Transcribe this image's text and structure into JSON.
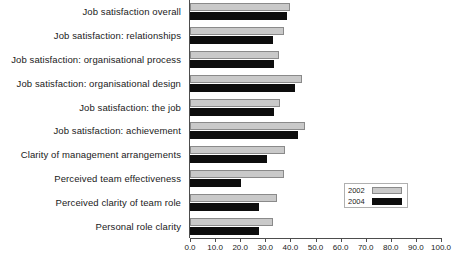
{
  "chart_data": {
    "type": "bar",
    "orientation": "horizontal",
    "title": "",
    "xlabel": "",
    "ylabel": "",
    "xlim": [
      0,
      100
    ],
    "grid": false,
    "legend_position": "lower-right",
    "categories": [
      "Job satisfaction overall",
      "Job satisfaction: relationships",
      "Job satisfaction: organisational process",
      "Job satisfaction: organisational design",
      "Job satisfaction: the job",
      "Job satisfaction: achievement",
      "Clarity of management arrangements",
      "Perceived team effectiveness",
      "Perceived clarity of team role",
      "Personal role clarity"
    ],
    "series": [
      {
        "name": "2002",
        "color": "#c9c9c9",
        "values": [
          40.0,
          37.5,
          35.5,
          44.5,
          36.0,
          46.0,
          38.0,
          37.5,
          34.5,
          33.0
        ]
      },
      {
        "name": "2004",
        "color": "#0d0d0d",
        "values": [
          38.5,
          33.0,
          33.5,
          42.0,
          33.5,
          43.0,
          30.5,
          20.5,
          27.5,
          27.5
        ]
      }
    ],
    "xticks": [
      0.0,
      10.0,
      20.0,
      30.0,
      40.0,
      50.0,
      60.0,
      70.0,
      80.0,
      90.0,
      100.0
    ],
    "xtick_labels": [
      "0.0",
      "10.0",
      "20.0",
      "30.0",
      "40.0",
      "50.0",
      "60.0",
      "70.0",
      "80.0",
      "90.0",
      "100.0"
    ]
  },
  "legend": {
    "entries": [
      {
        "label": "2002",
        "swatch": "swatch-2002"
      },
      {
        "label": "2004",
        "swatch": "swatch-2004"
      }
    ]
  }
}
